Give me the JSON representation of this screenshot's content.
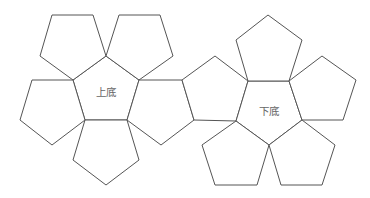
{
  "diagram": {
    "type": "net",
    "stroke_color": "#555555",
    "label_color": "#666666",
    "labels": {
      "top_base": "上底",
      "bottom_base": "下底"
    },
    "label_positions": {
      "top_base": [
        106,
        93
      ],
      "bottom_base": [
        269,
        112
      ]
    },
    "faces": [
      {
        "id": "top-base-center",
        "points": "106,56 139,80 127,120 85,120 73,80"
      },
      {
        "id": "top-left-petal",
        "points": "52,15 93,15 106,56 73,80 40,56"
      },
      {
        "id": "top-right-petal",
        "points": "119,15 160,15 173,56 139,80 106,56"
      },
      {
        "id": "left-petal",
        "points": "32,80 73,80 85,120 52,145 20,120"
      },
      {
        "id": "bottom-petal",
        "points": "85,120 127,120 139,160 106,185 73,160"
      },
      {
        "id": "right-petal",
        "points": "139,80 182,80 194,120 161,145 127,120"
      },
      {
        "id": "connector",
        "points": "215,56 248,81 236,121 194,120 182,80"
      },
      {
        "id": "bottom-base-center",
        "points": "248,81 289,81 302,120 269,145 236,121"
      },
      {
        "id": "upper-petal",
        "points": "268,15 302,40 289,81 248,81 236,40"
      },
      {
        "id": "upper-right-petal",
        "points": "289,81 322,56 356,80 343,120 302,120"
      },
      {
        "id": "lower-left-petal",
        "points": "236,121 269,145 257,185 215,185 202,145"
      },
      {
        "id": "lower-right-petal",
        "points": "302,120 335,145 322,185 281,185 269,145"
      }
    ]
  }
}
